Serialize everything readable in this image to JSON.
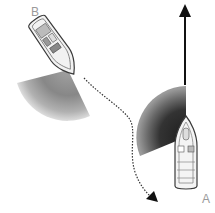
{
  "labels": {
    "boat_b": "B",
    "boat_a": "A"
  },
  "colors": {
    "background": "#ffffff",
    "boat_outline": "#3a3a3a",
    "boat_fill": "#f2f2f2",
    "sector_dark": "#2e2e2e",
    "sector_light": "#d8d8d8",
    "arrow": "#111111",
    "label": "#9a9a9a"
  },
  "boats": [
    {
      "id": "B",
      "heading": "southeast",
      "role": "give-way vessel turning to starboard"
    },
    {
      "id": "A",
      "heading": "north",
      "role": "stand-on vessel"
    }
  ],
  "paths": [
    {
      "name": "course-a",
      "style": "solid",
      "direction": "north"
    },
    {
      "name": "course-b",
      "style": "dotted",
      "direction": "south-east"
    }
  ]
}
